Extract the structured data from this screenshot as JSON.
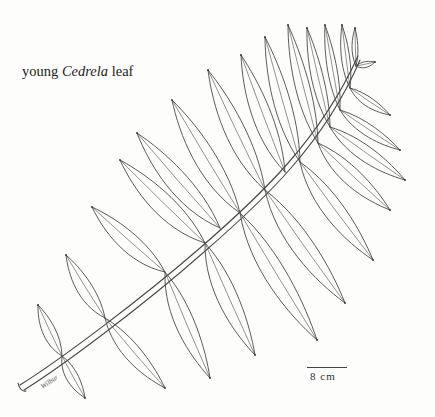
{
  "caption": {
    "prefix": "young ",
    "genus": "Cedrela",
    "suffix": " leaf"
  },
  "scale_bar": {
    "label": "8 cm"
  },
  "artist_signature": "Wilbur",
  "illustration": {
    "subject": "pinnately compound leaf",
    "style": "pen line drawing",
    "stroke_color": "#4a4a4a",
    "background_color": "#fdfdfc"
  }
}
